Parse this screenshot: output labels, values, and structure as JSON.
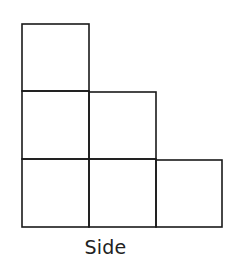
{
  "diagram": {
    "title": "Side",
    "view": "side-view",
    "columns": [
      {
        "index": 0,
        "height": 3
      },
      {
        "index": 1,
        "height": 2
      },
      {
        "index": 2,
        "height": 1
      }
    ],
    "colors": {
      "stroke": "#1a1a1a",
      "background": "#ffffff"
    }
  }
}
